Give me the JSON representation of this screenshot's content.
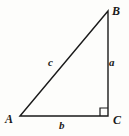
{
  "figure": {
    "background_color": "#fdfdfb",
    "stroke_color": "#1a1a1a",
    "text_color": "#1a1a1a",
    "vertices": [
      {
        "id": "A",
        "label": "A",
        "x": 20,
        "y": 116
      },
      {
        "id": "B",
        "label": "B",
        "x": 108,
        "y": 11
      },
      {
        "id": "C",
        "label": "C",
        "x": 108,
        "y": 116
      }
    ],
    "sides": [
      {
        "id": "a",
        "label": "a",
        "from": "B",
        "to": "C",
        "description": "vertical-leg"
      },
      {
        "id": "b",
        "label": "b",
        "from": "A",
        "to": "C",
        "description": "horizontal-leg"
      },
      {
        "id": "c",
        "label": "c",
        "from": "A",
        "to": "B",
        "description": "hypotenuse"
      }
    ],
    "right_angle": {
      "at_vertex": "C",
      "marker": "square",
      "size": 8
    }
  }
}
